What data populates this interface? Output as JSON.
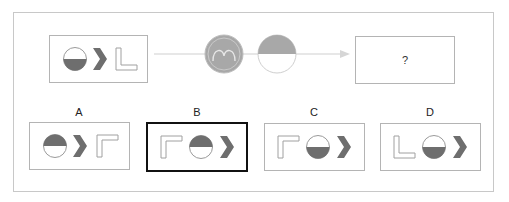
{
  "question": {
    "sequence_box": {
      "items": [
        "half-circle-bottom-filled-icon",
        "chevron-right-icon",
        "l-shape-icon"
      ]
    },
    "operators": [
      "m-circle-icon",
      "half-circle-top-filled-icon"
    ],
    "result_box": {
      "text": "?"
    }
  },
  "options": [
    {
      "label": "A",
      "items": [
        "half-circle-top-filled-icon",
        "chevron-right-icon",
        "corner-shape-icon"
      ],
      "selected": false
    },
    {
      "label": "B",
      "items": [
        "corner-shape-icon",
        "half-circle-top-filled-icon",
        "chevron-right-icon"
      ],
      "selected": true
    },
    {
      "label": "C",
      "items": [
        "corner-shape-icon",
        "half-circle-bottom-filled-icon",
        "chevron-right-icon"
      ],
      "selected": false
    },
    {
      "label": "D",
      "items": [
        "l-shape-icon",
        "half-circle-bottom-filled-icon",
        "chevron-right-icon"
      ],
      "selected": false
    }
  ],
  "colors": {
    "fill_dark": "#6e6e6e",
    "fill_gray": "#a8a8a8",
    "outline": "#b4b4b4",
    "selected_border": "#111111"
  }
}
